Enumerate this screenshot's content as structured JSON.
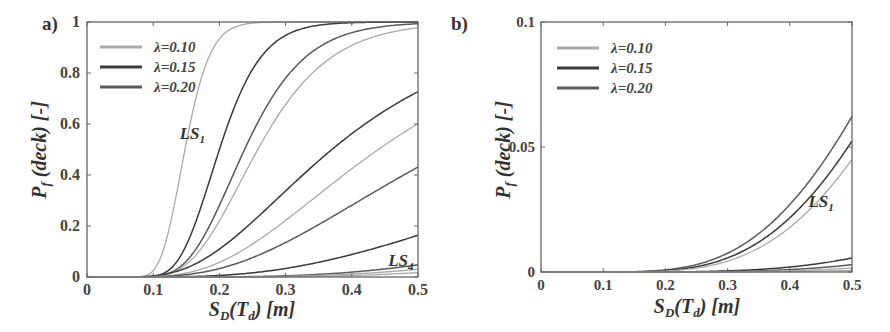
{
  "chart_data": [
    {
      "panel_label": "a)",
      "type": "line",
      "xlabel": "S_D(T_d) [m]",
      "ylabel": "P_f (deck) [-]",
      "xlim": [
        0,
        0.5
      ],
      "ylim": [
        0,
        1
      ],
      "xticks": [
        "0",
        "0.1",
        "0.2",
        "0.3",
        "0.4",
        "0.5"
      ],
      "yticks": [
        "0",
        "0.2",
        "0.4",
        "0.6",
        "0.8",
        "1"
      ],
      "grid": false,
      "legend": {
        "position": "upper-left",
        "entries": [
          {
            "label": "λ=0.10",
            "color": "#a9a9a9"
          },
          {
            "label": "λ=0.15",
            "color": "#3a3a3a"
          },
          {
            "label": "λ=0.20",
            "color": "#5a5a5a"
          }
        ]
      },
      "annotations": [
        {
          "text": "LS",
          "sub": "1",
          "x": 0.14,
          "y": 0.54
        },
        {
          "text": "LS",
          "sub": "4",
          "x": 0.455,
          "y": 0.045
        }
      ],
      "x": [
        0,
        0.05,
        0.1,
        0.15,
        0.2,
        0.25,
        0.3,
        0.35,
        0.4,
        0.45,
        0.5
      ],
      "series": [
        {
          "name": "LS1 λ=0.10",
          "color": "#a9a9a9",
          "median": 0.148,
          "beta": 0.2,
          "values": [
            0,
            0.0,
            0.03,
            0.53,
            0.93,
            0.995,
            1.0,
            1.0,
            1.0,
            1.0,
            1.0
          ]
        },
        {
          "name": "LS1 λ=0.15",
          "color": "#3a3a3a",
          "median": 0.2,
          "beta": 0.25,
          "values": [
            0,
            0.0,
            0.003,
            0.13,
            0.5,
            0.81,
            0.95,
            0.99,
            1.0,
            1.0,
            1.0
          ]
        },
        {
          "name": "LS1 λ=0.20",
          "color": "#5a5a5a",
          "median": 0.238,
          "beta": 0.3,
          "values": [
            0,
            0.0,
            0.002,
            0.06,
            0.28,
            0.57,
            0.78,
            0.9,
            0.95,
            0.98,
            0.99
          ]
        },
        {
          "name": "LS2 λ=0.10",
          "color": "#a9a9a9",
          "median": 0.258,
          "beta": 0.33,
          "values": [
            0,
            0.0,
            0.002,
            0.05,
            0.22,
            0.46,
            0.67,
            0.82,
            0.9,
            0.94,
            0.97
          ]
        },
        {
          "name": "LS3 λ=0.15",
          "color": "#3a3a3a",
          "median": 0.37,
          "beta": 0.5,
          "values": [
            0,
            0.0,
            0.004,
            0.035,
            0.11,
            0.23,
            0.35,
            0.48,
            0.58,
            0.66,
            0.72
          ]
        },
        {
          "name": "LS3 λ=0.10",
          "color": "#a9a9a9",
          "median": 0.44,
          "beta": 0.5,
          "values": [
            0,
            0.0,
            0.002,
            0.016,
            0.06,
            0.13,
            0.23,
            0.33,
            0.43,
            0.5,
            0.56
          ]
        },
        {
          "name": "LS3 λ=0.20",
          "color": "#5a5a5a",
          "median": 0.55,
          "beta": 0.55,
          "values": [
            0,
            0.0,
            0.001,
            0.008,
            0.03,
            0.07,
            0.13,
            0.2,
            0.28,
            0.35,
            0.42
          ]
        },
        {
          "name": "LS4 λ=0.15",
          "color": "#3a3a3a",
          "median": 0.9,
          "beta": 0.6,
          "values": [
            0,
            0.0,
            0.0,
            0.001,
            0.006,
            0.017,
            0.035,
            0.06,
            0.09,
            0.12,
            0.16
          ]
        },
        {
          "name": "LS4 λ=0.20",
          "color": "#5a5a5a",
          "median": 1.25,
          "beta": 0.55,
          "values": [
            0,
            0.0,
            0.0,
            0.0,
            0.0,
            0.002,
            0.006,
            0.012,
            0.022,
            0.034,
            0.05
          ]
        },
        {
          "name": "LS4 λ=0.10",
          "color": "#a9a9a9",
          "median": 1.4,
          "beta": 0.55,
          "values": [
            0,
            0.0,
            0.0,
            0.0,
            0.0,
            0.001,
            0.003,
            0.007,
            0.013,
            0.021,
            0.03
          ]
        },
        {
          "name": "LS4 λ=0.10 (b)",
          "color": "#a9a9a9",
          "median": 1.6,
          "beta": 0.55,
          "values": [
            0,
            0.0,
            0.0,
            0.0,
            0.0,
            0.0,
            0.002,
            0.004,
            0.008,
            0.013,
            0.02
          ]
        }
      ]
    },
    {
      "panel_label": "b)",
      "type": "line",
      "xlabel": "S_D(T_d) [m]",
      "ylabel": "P_f (deck) [-]",
      "xlim": [
        0,
        0.5
      ],
      "ylim": [
        0,
        0.1
      ],
      "xticks": [
        "0",
        "0.1",
        "0.2",
        "0.3",
        "0.4",
        "0.5"
      ],
      "yticks": [
        "0",
        "0.05",
        "0.1"
      ],
      "grid": false,
      "legend": {
        "position": "upper-left",
        "entries": [
          {
            "label": "λ=0.10",
            "color": "#a9a9a9"
          },
          {
            "label": "λ=0.15",
            "color": "#3a3a3a"
          },
          {
            "label": "λ=0.20",
            "color": "#5a5a5a"
          }
        ]
      },
      "annotations": [
        {
          "text": "LS",
          "sub": "1",
          "x": 0.43,
          "y": 0.026
        }
      ],
      "x": [
        0,
        0.05,
        0.1,
        0.15,
        0.2,
        0.25,
        0.3,
        0.35,
        0.4,
        0.45,
        0.5
      ],
      "series": [
        {
          "name": "LS1 λ=0.20",
          "color": "#5a5a5a",
          "median": 1.2,
          "beta": 0.57,
          "values": [
            0,
            0.0,
            0.0,
            0.0002,
            0.0013,
            0.004,
            0.0095,
            0.018,
            0.03,
            0.045,
            0.063
          ]
        },
        {
          "name": "LS1 λ=0.15",
          "color": "#3a3a3a",
          "median": 1.24,
          "beta": 0.56,
          "values": [
            0,
            0.0,
            0.0,
            0.0002,
            0.0012,
            0.0038,
            0.009,
            0.017,
            0.028,
            0.041,
            0.056
          ]
        },
        {
          "name": "LS1 λ=0.10",
          "color": "#a9a9a9",
          "median": 1.27,
          "beta": 0.55,
          "values": [
            0,
            0.0,
            0.0,
            0.0002,
            0.0011,
            0.0036,
            0.0085,
            0.016,
            0.026,
            0.038,
            0.051
          ]
        },
        {
          "name": "LS2 λ=0.15",
          "color": "#3a3a3a",
          "median": 2.6,
          "beta": 0.65,
          "values": [
            0,
            0.0,
            0.0,
            0.0,
            0.0,
            0.0002,
            0.0006,
            0.0013,
            0.0025,
            0.0042,
            0.0065
          ]
        },
        {
          "name": "LS2 λ=0.20",
          "color": "#5a5a5a",
          "median": 3.0,
          "beta": 0.65,
          "values": [
            0,
            0.0,
            0.0,
            0.0,
            0.0,
            0.0001,
            0.0004,
            0.0009,
            0.0017,
            0.003,
            0.0045
          ]
        },
        {
          "name": "LS2 λ=0.10",
          "color": "#a9a9a9",
          "median": 3.4,
          "beta": 0.65,
          "values": [
            0,
            0.0,
            0.0,
            0.0,
            0.0,
            0.0,
            0.0002,
            0.0006,
            0.0012,
            0.002,
            0.0032
          ]
        },
        {
          "name": "LS3 λ=0.10",
          "color": "#a9a9a9",
          "median": 4.5,
          "beta": 0.68,
          "values": [
            0,
            0.0,
            0.0,
            0.0,
            0.0,
            0.0,
            0.0001,
            0.0003,
            0.0006,
            0.001,
            0.0018
          ]
        }
      ]
    }
  ]
}
